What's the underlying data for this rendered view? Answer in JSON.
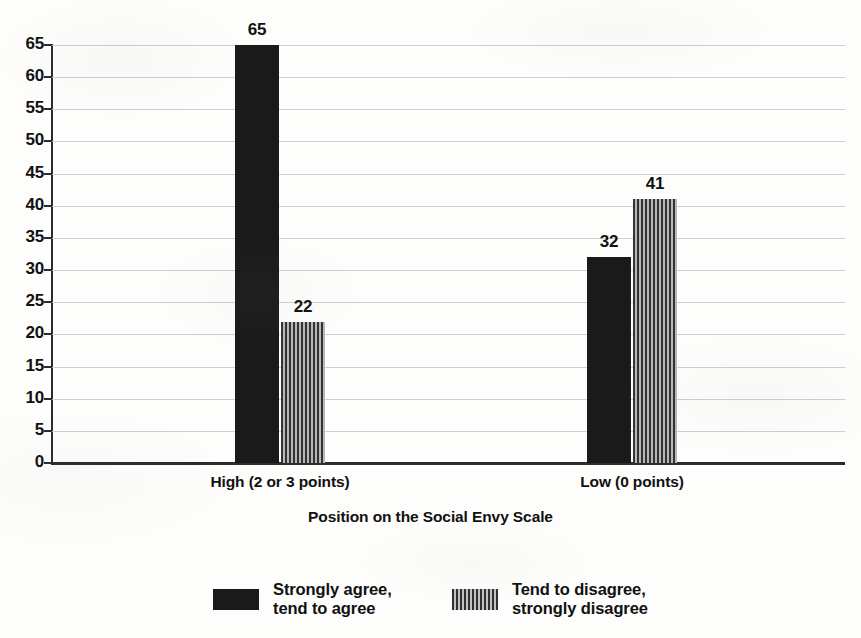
{
  "chart_data": {
    "type": "bar",
    "title": "",
    "xlabel": "Position on the Social Envy Scale",
    "ylabel": "",
    "categories": [
      "High (2 or 3 points)",
      "Low (0 points)"
    ],
    "series": [
      {
        "name": "Strongly agree,\ntend to agree",
        "values": [
          65,
          32
        ],
        "pattern": "solid",
        "color": "#1a1a1a"
      },
      {
        "name": "Tend to disagree,\nstrongly disagree",
        "values": [
          22,
          41
        ],
        "pattern": "vertical-stripes",
        "color": "#6e6e6e"
      }
    ],
    "ylim": [
      0,
      65
    ],
    "ytick_step": 5,
    "yticks": [
      0,
      5,
      10,
      15,
      20,
      25,
      30,
      35,
      40,
      45,
      50,
      55,
      60,
      65
    ],
    "ytick_labels": [
      "0",
      "5",
      "10",
      "15",
      "20",
      "25",
      "30",
      "35",
      "40",
      "45",
      "50",
      "55",
      "60",
      "65"
    ],
    "grid": true,
    "grid_color": "#cfcfcf",
    "axis_color": "#2b2b2b",
    "background": "#fdfdfb",
    "legend_position": "bottom",
    "data_labels": [
      "65",
      "22",
      "32",
      "41"
    ]
  },
  "axis": {
    "x_title": "Position on the Social Envy Scale"
  },
  "legend": {
    "items": [
      {
        "label": "Strongly agree,\ntend to agree",
        "swatch": "solid"
      },
      {
        "label": "Tend to disagree,\nstrongly disagree",
        "swatch": "hatch"
      }
    ]
  }
}
